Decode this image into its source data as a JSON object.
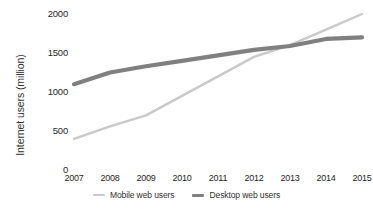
{
  "chart_data": {
    "type": "line",
    "title": "",
    "subtitle": "",
    "xlabel": "",
    "ylabel": "Internet users (million)",
    "categories": [
      "2007",
      "2008",
      "2009",
      "2010",
      "2011",
      "2012",
      "2013",
      "2014",
      "2015"
    ],
    "x": [
      2007,
      2008,
      2009,
      2010,
      2011,
      2012,
      2013,
      2014,
      2015
    ],
    "ylim": [
      0,
      2000
    ],
    "yticks": [
      0,
      500,
      1000,
      1500,
      2000
    ],
    "ytick_labels": [
      "0",
      "500",
      "1000",
      "1500",
      "2000"
    ],
    "grid": false,
    "legend_position": "bottom",
    "series": [
      {
        "name": "Mobile web users",
        "color": "#c9c9c9",
        "values": [
          400,
          560,
          700,
          950,
          1200,
          1450,
          1600,
          1800,
          2000
        ]
      },
      {
        "name": "Desktop web users",
        "color": "#808080",
        "values": [
          1100,
          1250,
          1330,
          1400,
          1470,
          1540,
          1590,
          1680,
          1700
        ]
      }
    ],
    "annotations": []
  },
  "axes": {
    "y_title": "Internet users (million)",
    "y_ticks": [
      "0",
      "500",
      "1000",
      "1500",
      "2000"
    ],
    "x_ticks": [
      "2007",
      "2008",
      "2009",
      "2010",
      "2011",
      "2012",
      "2013",
      "2014",
      "2015"
    ]
  },
  "legend": {
    "items": [
      {
        "label": "Mobile web users",
        "color": "#c9c9c9"
      },
      {
        "label": "Desktop web users",
        "color": "#808080"
      }
    ]
  },
  "colors": {
    "background": "#ffffff",
    "text": "#262626",
    "mobile_line": "#c9c9c9",
    "desktop_line": "#808080"
  }
}
